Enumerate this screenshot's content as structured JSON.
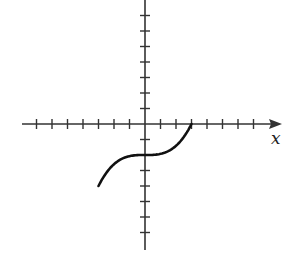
{
  "chart_data": {
    "type": "line",
    "title": "",
    "xlabel": "x",
    "ylabel": "",
    "xlim": [
      -8,
      8.5
    ],
    "ylim": [
      -8,
      7.5
    ],
    "grid": false,
    "legend": null,
    "x_ticks": [
      -7,
      -6,
      -5,
      -4,
      -3,
      -2,
      -1,
      1,
      2,
      3,
      4,
      5,
      6,
      7
    ],
    "y_ticks": [
      -7,
      -6,
      -5,
      -4,
      -3,
      -2,
      -1,
      1,
      2,
      3,
      4,
      5,
      6,
      7
    ],
    "tick_labels_shown": false,
    "series": [
      {
        "name": "curve",
        "description": "cubic with inflection point at (0,-2), from (-3,-4) to (3,0)",
        "x": [
          -3,
          -2.5,
          -2,
          -1.5,
          -1,
          -0.5,
          0,
          0.5,
          1,
          1.5,
          2,
          2.5,
          3
        ],
        "y": [
          -4,
          -3.16,
          -2.59,
          -2.25,
          -2.07,
          -2.01,
          -2,
          -1.99,
          -1.93,
          -1.75,
          -1.41,
          -0.84,
          0
        ],
        "color": "#111111"
      }
    ]
  },
  "axes": {
    "x_label": "x",
    "color": "#333333"
  }
}
